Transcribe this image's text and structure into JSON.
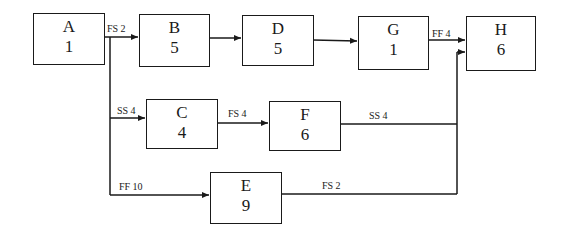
{
  "nodes": [
    {
      "id": "A",
      "name": "A",
      "duration": "1"
    },
    {
      "id": "B",
      "name": "B",
      "duration": "5"
    },
    {
      "id": "D",
      "name": "D",
      "duration": "5"
    },
    {
      "id": "G",
      "name": "G",
      "duration": "1"
    },
    {
      "id": "H",
      "name": "H",
      "duration": "6"
    },
    {
      "id": "C",
      "name": "C",
      "duration": "4"
    },
    {
      "id": "F",
      "name": "F",
      "duration": "6"
    },
    {
      "id": "E",
      "name": "E",
      "duration": "9"
    }
  ],
  "links": [
    {
      "from": "A",
      "to": "B",
      "label": "FS 2"
    },
    {
      "from": "B",
      "to": "D",
      "label": ""
    },
    {
      "from": "D",
      "to": "G",
      "label": ""
    },
    {
      "from": "G",
      "to": "H",
      "label": "FF 4"
    },
    {
      "from": "A",
      "to": "C",
      "label": "SS 4"
    },
    {
      "from": "C",
      "to": "F",
      "label": "FS 4"
    },
    {
      "from": "F",
      "to": "H",
      "label": "SS 4"
    },
    {
      "from": "A",
      "to": "E",
      "label": "FF 10"
    },
    {
      "from": "E",
      "to": "H",
      "label": "FS 2"
    }
  ],
  "colors": {
    "line": "#1a1a1a",
    "background": "#ffffff"
  }
}
